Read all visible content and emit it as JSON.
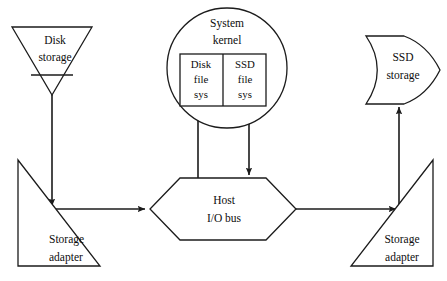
{
  "diagram": {
    "background_color": "#ffffff",
    "line_color": "#1b1b1b",
    "nodes": {
      "disk_storage": {
        "label_line1": "Disk",
        "label_line2": "storage",
        "shape": "inverted-triangle-tape"
      },
      "system_kernel": {
        "label_line1": "System",
        "label_line2": "kernel",
        "shape": "circle"
      },
      "disk_file_sys": {
        "label_line1": "Disk",
        "label_line2": "file",
        "label_line3": "sys",
        "shape": "rectangle"
      },
      "ssd_file_sys": {
        "label_line1": "SSD",
        "label_line2": "file",
        "label_line3": "sys",
        "shape": "rectangle"
      },
      "ssd_storage": {
        "label_line1": "SSD",
        "label_line2": "storage",
        "shape": "d-shape"
      },
      "host_io_bus": {
        "label_line1": "Host",
        "label_line2": "I/O bus",
        "shape": "hexagon"
      },
      "storage_adapter_left": {
        "label_line1": "Storage",
        "label_line2": "adapter",
        "shape": "right-triangle"
      },
      "storage_adapter_right": {
        "label_line1": "Storage",
        "label_line2": "adapter",
        "shape": "right-triangle-mirrored"
      }
    },
    "geometry": {
      "disk_storage_triangle": "12,27 92,27 52,95",
      "disk_storage_tapeline": {
        "x1": 31,
        "y1": 75,
        "x2": 73,
        "y2": 75
      },
      "kernel_circle": {
        "cx": 227,
        "cy": 68,
        "r": 60
      },
      "fs_box": {
        "x": 180,
        "y": 54,
        "width": 86,
        "height": 52
      },
      "fs_box_divider_x": 223,
      "ssd_storage_path": "M 366 36 C 382 60, 382 80, 366 104 L 404 104 C 424 96, 434 80, 440 70 C 434 60, 424 44, 404 36 Z",
      "hexagon": "180,178 266,178 296,209 266,240 180,240 150,209",
      "adapter_left_triangle": "18,160 18,266 100,266",
      "adapter_right_triangle": "351,266 433,266 433,160"
    },
    "connectors": [
      {
        "name": "disk-storage-to-adapter",
        "from": "disk_storage",
        "to": "storage_adapter_left",
        "arrow": "down"
      },
      {
        "name": "adapter-left-to-bus",
        "from": "storage_adapter_left",
        "to": "host_io_bus",
        "arrow": "right"
      },
      {
        "name": "bus-to-adapter-right",
        "from": "host_io_bus",
        "to": "storage_adapter_right",
        "arrow": "right"
      },
      {
        "name": "adapter-right-to-ssd-storage",
        "from": "storage_adapter_right",
        "to": "ssd_storage",
        "arrow": "up"
      },
      {
        "name": "bus-to-disk-file-sys",
        "from": "host_io_bus",
        "to": "disk_file_sys",
        "arrow": "up"
      },
      {
        "name": "ssd-file-sys-to-bus",
        "from": "ssd_file_sys",
        "to": "host_io_bus",
        "arrow": "down"
      }
    ]
  }
}
